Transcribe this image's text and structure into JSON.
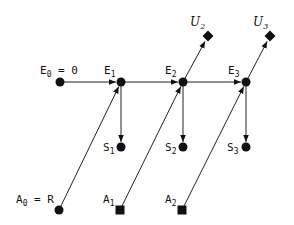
{
  "diagram": {
    "type": "flow-graph",
    "nodes": [
      {
        "id": "E0",
        "label": "E",
        "sub": "0",
        "suffix": " = 0",
        "shape": "circle",
        "x": 60,
        "y": 82,
        "lx": 40,
        "ly": 74
      },
      {
        "id": "E1",
        "label": "E",
        "sub": "1",
        "suffix": "",
        "shape": "circle",
        "x": 121,
        "y": 82,
        "lx": 104,
        "ly": 74
      },
      {
        "id": "E2",
        "label": "E",
        "sub": "2",
        "suffix": "",
        "shape": "circle",
        "x": 183,
        "y": 82,
        "lx": 165,
        "ly": 74
      },
      {
        "id": "E3",
        "label": "E",
        "sub": "3",
        "suffix": "",
        "shape": "circle",
        "x": 246,
        "y": 82,
        "lx": 228,
        "ly": 74
      },
      {
        "id": "U2",
        "label": "U",
        "sub": "2",
        "suffix": "",
        "shape": "diamond",
        "x": 208,
        "y": 36,
        "lx": 190,
        "ly": 26
      },
      {
        "id": "U3",
        "label": "U",
        "sub": "3",
        "suffix": "",
        "shape": "diamond",
        "x": 270,
        "y": 36,
        "lx": 253,
        "ly": 26
      },
      {
        "id": "S1",
        "label": "S",
        "sub": "1",
        "suffix": "",
        "shape": "circle",
        "x": 121,
        "y": 147,
        "lx": 103,
        "ly": 151
      },
      {
        "id": "S2",
        "label": "S",
        "sub": "2",
        "suffix": "",
        "shape": "circle",
        "x": 183,
        "y": 147,
        "lx": 165,
        "ly": 151
      },
      {
        "id": "S3",
        "label": "S",
        "sub": "3",
        "suffix": "",
        "shape": "circle",
        "x": 246,
        "y": 147,
        "lx": 227,
        "ly": 151
      },
      {
        "id": "A0",
        "label": "A",
        "sub": "0",
        "suffix": " = R",
        "shape": "circle",
        "x": 59,
        "y": 210,
        "lx": 16,
        "ly": 203
      },
      {
        "id": "A1",
        "label": "A",
        "sub": "1",
        "suffix": "",
        "shape": "square",
        "x": 120,
        "y": 210,
        "lx": 103,
        "ly": 203
      },
      {
        "id": "A2",
        "label": "A",
        "sub": "2",
        "suffix": "",
        "shape": "square",
        "x": 182,
        "y": 210,
        "lx": 165,
        "ly": 203
      }
    ],
    "edges": [
      {
        "from": "E0",
        "to": "E1",
        "arrow": true
      },
      {
        "from": "E1",
        "to": "E2",
        "arrow": true
      },
      {
        "from": "E2",
        "to": "E3",
        "arrow": true
      },
      {
        "from": "E1",
        "to": "S1",
        "arrow": true
      },
      {
        "from": "E2",
        "to": "S2",
        "arrow": true
      },
      {
        "from": "E3",
        "to": "S3",
        "arrow": true
      },
      {
        "from": "E2",
        "to": "U2",
        "arrow": true
      },
      {
        "from": "E3",
        "to": "U3",
        "arrow": true
      },
      {
        "from": "A0",
        "to": "E1",
        "arrow": true
      },
      {
        "from": "A1",
        "to": "E2",
        "arrow": true
      },
      {
        "from": "A2",
        "to": "E3",
        "arrow": true
      }
    ],
    "colors": {
      "ink": "#111111",
      "background": "#ffffff"
    }
  }
}
